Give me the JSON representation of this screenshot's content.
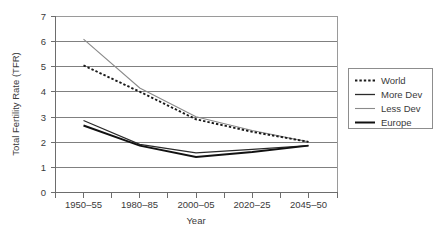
{
  "chart_data": {
    "type": "line",
    "title": "",
    "xlabel": "Year",
    "ylabel": "Total Fertility Rate (TFR)",
    "categories": [
      "1950–55",
      "1980–85",
      "2000–05",
      "2020–25",
      "2045–50"
    ],
    "ylim": [
      0,
      7
    ],
    "yticks": [
      "0",
      "1",
      "2",
      "3",
      "4",
      "5",
      "6",
      "7"
    ],
    "grid": "horizontal",
    "legend_position": "right-outside",
    "series": [
      {
        "name": "World",
        "values": [
          5.05,
          4.0,
          2.9,
          2.4,
          2.0
        ],
        "style": "dotted",
        "color": "#1a1a1a",
        "width": 1.9
      },
      {
        "name": "More Dev",
        "values": [
          2.85,
          1.9,
          1.56,
          1.7,
          1.85
        ],
        "style": "solid",
        "color": "#2b2b2b",
        "width": 1.2
      },
      {
        "name": "Less Dev",
        "values": [
          6.1,
          4.15,
          3.0,
          2.45,
          2.0
        ],
        "style": "solid",
        "color": "#8a8a8a",
        "width": 1.1
      },
      {
        "name": "Europe",
        "values": [
          2.65,
          1.85,
          1.4,
          1.6,
          1.85
        ],
        "style": "solid",
        "color": "#111111",
        "width": 2.0
      }
    ]
  },
  "axes": {
    "y_title": "Total Fertility Rate (TFR)",
    "x_title": "Year",
    "y_tick_labels": [
      "7",
      "6",
      "5",
      "4",
      "3",
      "2",
      "1",
      "0"
    ],
    "x_tick_labels": [
      "1950–55",
      "1980–85",
      "2000–05",
      "2020–25",
      "2045–50"
    ]
  },
  "legend": {
    "items": [
      {
        "label": "World",
        "swatch": "dotted-line-swatch"
      },
      {
        "label": "More Dev",
        "swatch": "solid-line-swatch"
      },
      {
        "label": "Less Dev",
        "swatch": "light-line-swatch"
      },
      {
        "label": "Europe",
        "swatch": "thick-line-swatch"
      }
    ]
  },
  "colors": {
    "background": "#ffffff",
    "grid": "#808080",
    "axis": "#6d6d6d",
    "text": "#3a3a3a",
    "world": "#1a1a1a",
    "more_dev": "#2b2b2b",
    "less_dev": "#8a8a8a",
    "europe": "#111111"
  }
}
